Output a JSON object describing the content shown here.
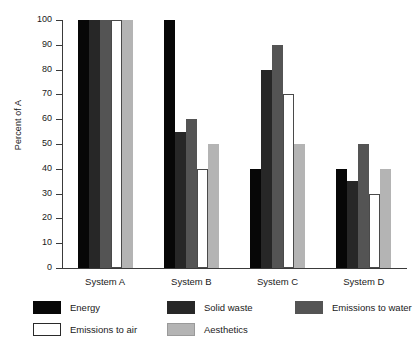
{
  "chart_data": {
    "type": "bar",
    "title": "",
    "xlabel": "",
    "ylabel": "Percent of A",
    "ylim": [
      0,
      100
    ],
    "ytick_step": 10,
    "yticks": [
      0,
      10,
      20,
      30,
      40,
      50,
      60,
      70,
      80,
      90,
      100
    ],
    "ytick_labels": [
      "0",
      "10",
      "20",
      "30",
      "40",
      "50",
      "60",
      "70",
      "80",
      "90",
      "100"
    ],
    "grid": false,
    "legend_position": "below-plot",
    "categories": [
      "System A",
      "System B",
      "System C",
      "System D"
    ],
    "series": [
      {
        "name": "Energy",
        "color": "#070707",
        "values": [
          100,
          100,
          40,
          40
        ]
      },
      {
        "name": "Solid waste",
        "color": "#272727",
        "values": [
          100,
          55,
          80,
          35
        ]
      },
      {
        "name": "Emissions to water",
        "color": "#545454",
        "values": [
          100,
          60,
          90,
          50
        ]
      },
      {
        "name": "Emissions to air",
        "color": "#ffffff",
        "values": [
          100,
          40,
          70,
          30
        ]
      },
      {
        "name": "Aesthetics",
        "color": "#b4b4b4",
        "values": [
          100,
          50,
          50,
          40
        ]
      }
    ]
  },
  "axis": {
    "y_title": "Percent of A"
  },
  "legend": {
    "items": [
      {
        "label": "Energy",
        "swatch": "sw-energy"
      },
      {
        "label": "Solid waste",
        "swatch": "sw-solid-waste"
      },
      {
        "label": "Emissions to water",
        "swatch": "sw-emissions-water"
      },
      {
        "label": "Emissions to air",
        "swatch": "sw-emissions-air"
      },
      {
        "label": "Aesthetics",
        "swatch": "sw-aesthetics"
      }
    ]
  }
}
